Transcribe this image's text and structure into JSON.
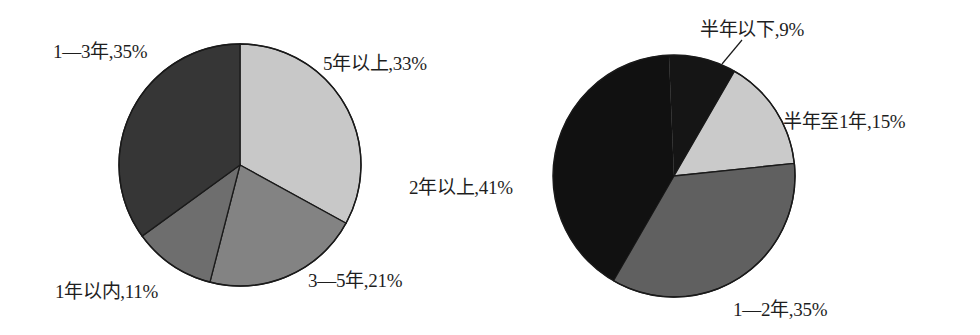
{
  "chart_data": [
    {
      "type": "pie",
      "title": "",
      "start_angle_deg": 0,
      "direction": "clockwise",
      "center": [
        240,
        165
      ],
      "radius": 121,
      "slices": [
        {
          "label": "5年以上",
          "value": 33,
          "text": "5年以上,33%",
          "color": "#c8c8c8",
          "label_pos": [
            323,
            48
          ]
        },
        {
          "label": "3—5年",
          "value": 21,
          "text": "3—5年,21%",
          "color": "#838383",
          "label_pos": [
            308,
            265
          ]
        },
        {
          "label": "1年以内",
          "value": 11,
          "text": "1年以内,11%",
          "color": "#6e6e6e",
          "label_pos": [
            55,
            276
          ]
        },
        {
          "label": "1—3年",
          "value": 35,
          "text": "1—3年,35%",
          "color": "#363636",
          "label_pos": [
            53,
            36
          ]
        }
      ]
    },
    {
      "type": "pie",
      "title": "",
      "start_angle_deg": 30,
      "direction": "clockwise",
      "center": [
        184,
        176
      ],
      "radius": 121,
      "slices": [
        {
          "label": "半年至1年",
          "value": 15,
          "text": "半年至1年,15%",
          "color": "#cacaca",
          "label_pos": [
            293,
            106
          ]
        },
        {
          "label": "1—2年",
          "value": 35,
          "text": "1—2年,35%",
          "color": "#606060",
          "label_pos": [
            243,
            294
          ]
        },
        {
          "label": "2年以上",
          "value": 41,
          "text": "2年以上,41%",
          "color": "#111111",
          "label_pos": [
            -81,
            172
          ]
        },
        {
          "label": "半年以下",
          "value": 9,
          "text": "半年以下,9%",
          "color": "#151515",
          "label_pos": [
            210,
            14
          ]
        }
      ],
      "leader_line": {
        "from": [
          232,
          64
        ],
        "to": [
          252,
          40
        ]
      }
    }
  ]
}
